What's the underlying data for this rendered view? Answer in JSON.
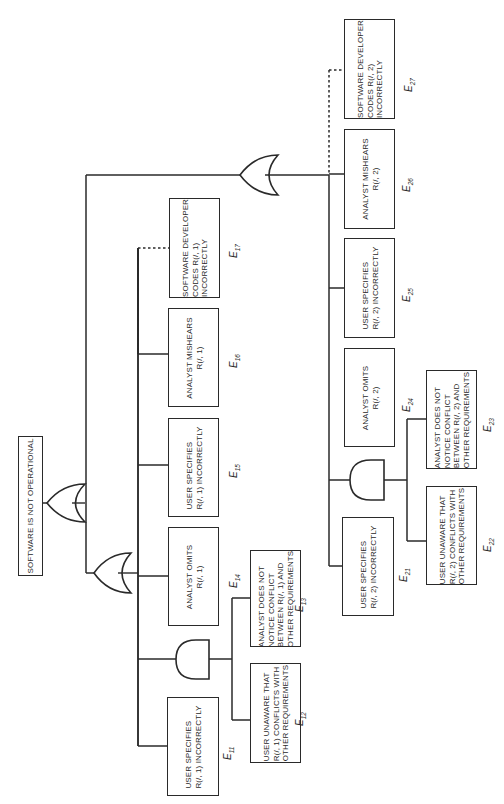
{
  "diagram": {
    "type": "fault-tree",
    "orientation": "rotated-90-ccw",
    "top_event": {
      "id": "top",
      "text": "SOFTWARE IS NOT OPERATIONAL"
    },
    "gates": [
      {
        "id": "g-top",
        "type": "OR",
        "children": [
          "branch-1",
          "branch-2"
        ]
      },
      {
        "id": "g-1",
        "type": "OR",
        "children": [
          "g-1-and",
          "E14",
          "E15",
          "E16",
          "E17"
        ]
      },
      {
        "id": "g-1-and",
        "type": "AND",
        "children": [
          "E12",
          "E13"
        ]
      },
      {
        "id": "g-2",
        "type": "OR",
        "children": [
          "g-2-and",
          "E24",
          "E25",
          "E26",
          "E27"
        ]
      },
      {
        "id": "g-2-and",
        "type": "AND",
        "children": [
          "E22",
          "E23"
        ]
      }
    ],
    "events": {
      "E11": {
        "label_base": "E",
        "label_sub": "11",
        "text": "USER SPECIFIES\nR(/, 1) INCORRECTLY"
      },
      "E12": {
        "label_base": "E",
        "label_sub": "12",
        "text": "USER UNAWARE THAT\nR(/, 1) CONFLICTS WITH\nOTHER REQUIREMENTS"
      },
      "E13": {
        "label_base": "E",
        "label_sub": "13",
        "text": "ANALYST DOES NOT\nNOTICE CONFLICT\nBETWEEN R(/, 1) AND\nOTHER REQUIREMENTS"
      },
      "E14": {
        "label_base": "E",
        "label_sub": "14",
        "text": "ANALYST OMITS\nR(/, 1)"
      },
      "E15": {
        "label_base": "E",
        "label_sub": "15",
        "text": "USER SPECIFIES\nR(/, 1) INCORRECTLY"
      },
      "E16": {
        "label_base": "E",
        "label_sub": "16",
        "text": "ANALYST MISHEARS\nR(/, 1)"
      },
      "E17": {
        "label_base": "E",
        "label_sub": "17",
        "text": "SOFTWARE DEVELOPER\nCODES R(/, 1)\nINCORRECTLY"
      },
      "E21": {
        "label_base": "E",
        "label_sub": "21",
        "text": "USER SPECIFIES\nR(/, 2) INCORRECTLY"
      },
      "E22": {
        "label_base": "E",
        "label_sub": "22",
        "text": "USER UNAWARE THAT\nR(/, 2) CONFLICTS WITH\nOTHER REQUIREMENTS"
      },
      "E23": {
        "label_base": "E",
        "label_sub": "23",
        "text": "ANALYST DOES NOT\nNOTICE CONFLICT\nBETWEEN R(/, 2) AND\nOTHER REQUIREMENTS"
      },
      "E24": {
        "label_base": "E",
        "label_sub": "24",
        "text": "ANALYST OMITS\nR(/, 2)"
      },
      "E25": {
        "label_base": "E",
        "label_sub": "25",
        "text": "USER SPECIFIES\nR(/, 2) INCORRECTLY"
      },
      "E26": {
        "label_base": "E",
        "label_sub": "26",
        "text": "ANALYST MISHEARS\nR(/, 2)"
      },
      "E27": {
        "label_base": "E",
        "label_sub": "27",
        "text": "SOFTWARE DEVELOPER\nCODES R(/, 2)\nINCORRECTLY"
      }
    },
    "dotted_links": [
      "E17",
      "E27"
    ]
  }
}
